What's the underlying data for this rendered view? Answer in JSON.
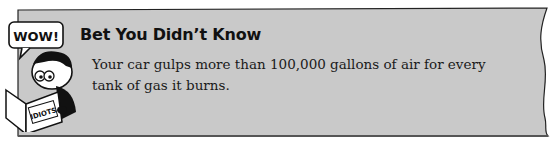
{
  "sidebar": {
    "title": "Bet You Didn’t Know",
    "body": "Your car gulps more than 100,000 gallons of air for every tank of gas it burns.",
    "cartoon": {
      "speech_bubble": "WOW!",
      "book_label": "IDIOTS"
    },
    "colors": {
      "panel_fill": "#c9c9c9",
      "panel_stroke": "#222222"
    }
  }
}
